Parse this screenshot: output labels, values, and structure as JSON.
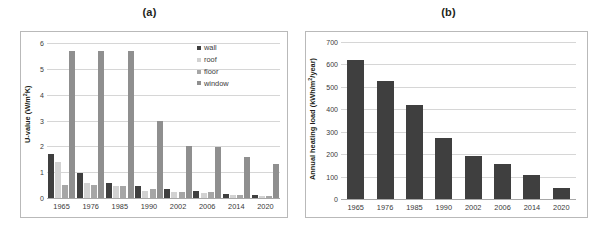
{
  "figure": {
    "panel_a_title": "(a)",
    "panel_b_title": "(b)"
  },
  "chart_data": [
    {
      "type": "bar",
      "panel": "(a)",
      "title": "(a)",
      "xlabel": "",
      "ylabel": "U-value (W/m²K)",
      "ylim": [
        0,
        6
      ],
      "yticks": [
        0,
        1,
        2,
        3,
        4,
        5,
        6
      ],
      "grid": true,
      "legend_position": "top-right",
      "categories": [
        "1965",
        "1976",
        "1985",
        "1990",
        "2002",
        "2006",
        "2014",
        "2020"
      ],
      "series": [
        {
          "name": "wall",
          "color": "#3f3f3f",
          "values": [
            1.7,
            0.98,
            0.6,
            0.45,
            0.35,
            0.29,
            0.17,
            0.1
          ]
        },
        {
          "name": "roof",
          "color": "#d2d2d2",
          "values": [
            1.38,
            0.58,
            0.48,
            0.26,
            0.22,
            0.21,
            0.1,
            0.09
          ]
        },
        {
          "name": "floor",
          "color": "#a6a6a6",
          "values": [
            0.49,
            0.49,
            0.48,
            0.34,
            0.23,
            0.22,
            0.11,
            0.09
          ]
        },
        {
          "name": "window",
          "color": "#8f8f8f",
          "values": [
            5.68,
            5.68,
            5.68,
            2.97,
            2.0,
            1.98,
            1.58,
            1.3
          ]
        }
      ]
    },
    {
      "type": "bar",
      "panel": "(b)",
      "title": "(b)",
      "xlabel": "",
      "ylabel": "Annual heating load (kWh/m²/year)",
      "ylim": [
        0,
        700
      ],
      "yticks": [
        0,
        100,
        200,
        300,
        400,
        500,
        600,
        700
      ],
      "grid": true,
      "legend_position": "none",
      "categories": [
        "1965",
        "1976",
        "1985",
        "1990",
        "2002",
        "2006",
        "2014",
        "2020"
      ],
      "values": [
        620,
        525,
        420,
        272,
        192,
        157,
        108,
        50
      ],
      "bar_color": "#3f3f3f"
    }
  ],
  "panel_a": {
    "ylabel_main": "U-value (W/m",
    "ylabel_sup": "2",
    "ylabel_tail": "K)",
    "yticks": [
      "6",
      "5",
      "4",
      "3",
      "2",
      "1",
      "0"
    ],
    "xlabels": [
      "1965",
      "1976",
      "1985",
      "1990",
      "2002",
      "2006",
      "2014",
      "2020"
    ],
    "legend": [
      {
        "label": "wall",
        "color": "#3f3f3f"
      },
      {
        "label": "roof",
        "color": "#d2d2d2"
      },
      {
        "label": "floor",
        "color": "#a6a6a6"
      },
      {
        "label": "window",
        "color": "#8f8f8f"
      }
    ]
  },
  "panel_b": {
    "ylabel_main": "Annual heating load (kWh/m",
    "ylabel_sup": "2",
    "ylabel_tail": "/year)",
    "yticks": [
      "700",
      "600",
      "500",
      "400",
      "300",
      "200",
      "100",
      "0"
    ],
    "xlabels": [
      "1965",
      "1976",
      "1985",
      "1990",
      "2002",
      "2006",
      "2014",
      "2020"
    ]
  }
}
